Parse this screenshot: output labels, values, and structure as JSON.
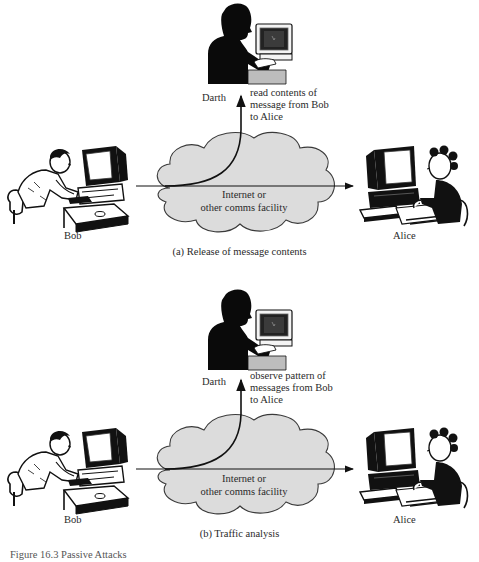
{
  "panels": [
    {
      "id": "a",
      "eavesdropper": "Darth",
      "sender": "Bob",
      "receiver": "Alice",
      "annotation": [
        "read contents of",
        "message from Bob",
        "to Alice"
      ],
      "network": [
        "Internet or",
        "other comms facility"
      ],
      "caption": "(a) Release of message contents"
    },
    {
      "id": "b",
      "eavesdropper": "Darth",
      "sender": "Bob",
      "receiver": "Alice",
      "annotation": [
        "observe pattern of",
        "messages from Bob",
        "to Alice"
      ],
      "network": [
        "Internet or",
        "other comms facility"
      ],
      "caption": "(b) Traffic analysis"
    }
  ],
  "figure_caption": "Figure 16.3  Passive Attacks",
  "colors": {
    "cloud_fill": "#dcdcdc",
    "cloud_stroke": "#3a3a3a",
    "line": "#111111",
    "silhouette": "#0a0a0a"
  }
}
